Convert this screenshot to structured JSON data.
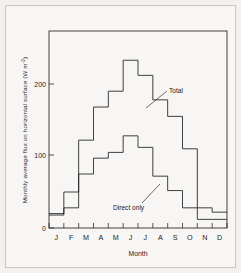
{
  "figure": {
    "background_color": "#f7f6f4",
    "ink_color": "#1f1f1f"
  },
  "chart_data": {
    "type": "line",
    "subtype": "step",
    "title": "",
    "xlabel": "Month",
    "ylabel": "Monthly average flux on horizontal surface (W m",
    "ylabel_exponent": "-2",
    "ylabel_open_paren": "(W m",
    "ylabel_close_paren": ")",
    "categories": [
      "J",
      "F",
      "M",
      "A",
      "M",
      "J",
      "J",
      "A",
      "S",
      "O",
      "N",
      "D"
    ],
    "month_labels": [
      "J",
      "F",
      "M",
      "A",
      "M",
      "J",
      "J",
      "A",
      "S",
      "O",
      "N",
      "D"
    ],
    "ylim": [
      0,
      260
    ],
    "xlim": [
      0,
      12
    ],
    "yticks": [
      0,
      100,
      200
    ],
    "ytick_labels": [
      "0",
      "100",
      "200"
    ],
    "grid": false,
    "legend_position": "inline-annotation",
    "series": [
      {
        "name": "Total",
        "label": "Total",
        "values": [
          20,
          50,
          122,
          168,
          190,
          233,
          212,
          178,
          155,
          110,
          28,
          22
        ]
      },
      {
        "name": "Direct only",
        "label": "Direct only",
        "values": [
          18,
          28,
          75,
          97,
          105,
          128,
          112,
          72,
          52,
          28,
          12,
          12
        ]
      }
    ],
    "annotations": [
      {
        "name": "total-annotation",
        "text": "Total",
        "x_px": 169,
        "y_px": 92
      },
      {
        "name": "direct-only-annotation",
        "text": "Direct only",
        "x_px": 113,
        "y_px": 209
      }
    ]
  }
}
